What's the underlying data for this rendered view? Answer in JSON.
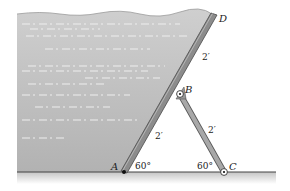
{
  "diagram": {
    "type": "statics-figure",
    "points": {
      "A": {
        "label": "A",
        "x": 124,
        "y": 172
      },
      "B": {
        "label": "B",
        "x": 180,
        "y": 94
      },
      "C": {
        "label": "C",
        "x": 224,
        "y": 172
      },
      "D": {
        "label": "D",
        "x": 214,
        "y": 14
      }
    },
    "dimensions": {
      "AB": "2′",
      "BD": "2′",
      "BC": "2′"
    },
    "angles": {
      "at_A": "60°",
      "at_C": "60°"
    },
    "colors": {
      "water_top": "#c8c8c8",
      "water_bottom": "#b0b0b0",
      "gate": "#8a8a8a",
      "gate_edge": "#555555",
      "strut": "#a8a8a8",
      "ground_line": "#444444",
      "ground_shadow": "#d6d6d6"
    }
  }
}
